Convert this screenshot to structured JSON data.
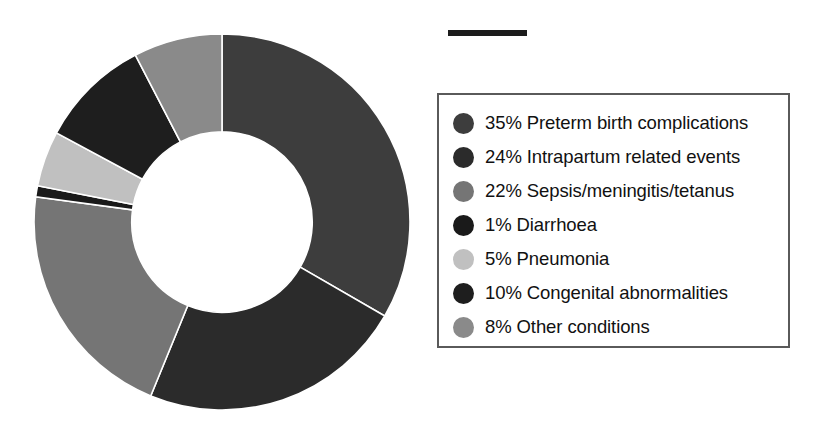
{
  "figure": {
    "background_color": "#ffffff",
    "title_rule": {
      "name": "title-rule",
      "color": "#1c1c1c"
    }
  },
  "chart_data": {
    "type": "pie",
    "variant": "donut",
    "title": "",
    "subtitle": "",
    "xlabel": "",
    "ylabel": "",
    "grid": false,
    "legend_position": "right",
    "hole_ratio": 0.48,
    "start_angle_deg": 0,
    "direction": "clockwise",
    "units": "percent",
    "total": 105,
    "categories": [
      "Preterm birth complications",
      "Intrapartum related events",
      "Sepsis/meningitis/tetanus",
      "Diarrhoea",
      "Pneumonia",
      "Congenital abnormalities",
      "Other conditions"
    ],
    "values": [
      35,
      24,
      22,
      1,
      5,
      10,
      8
    ],
    "colors": [
      "#3d3d3d",
      "#2b2b2b",
      "#757575",
      "#1a1a1a",
      "#c0c0c0",
      "#1e1e1e",
      "#8a8a8a"
    ],
    "slices": [
      {
        "percent_label": "35%",
        "label": "Preterm birth complications",
        "value": 35,
        "color": "#3d3d3d"
      },
      {
        "percent_label": "24%",
        "label": "Intrapartum related events",
        "value": 24,
        "color": "#2b2b2b"
      },
      {
        "percent_label": "22%",
        "label": "Sepsis/meningitis/tetanus",
        "value": 22,
        "color": "#757575"
      },
      {
        "percent_label": "1%",
        "label": "Diarrhoea",
        "value": 1,
        "color": "#1a1a1a"
      },
      {
        "percent_label": "5%",
        "label": "Pneumonia",
        "value": 5,
        "color": "#c0c0c0"
      },
      {
        "percent_label": "10%",
        "label": "Congenital abnormalities",
        "value": 10,
        "color": "#1e1e1e"
      },
      {
        "percent_label": "8%",
        "label": "Other conditions",
        "value": 8,
        "color": "#8a8a8a"
      }
    ]
  },
  "legend": {
    "border_color": "#5a5a5a",
    "items": [
      {
        "text": "35% Preterm birth complications",
        "color": "#3d3d3d"
      },
      {
        "text": "24% Intrapartum related events",
        "color": "#2b2b2b"
      },
      {
        "text": "22% Sepsis/meningitis/tetanus",
        "color": "#757575"
      },
      {
        "text": "1% Diarrhoea",
        "color": "#1a1a1a"
      },
      {
        "text": "5% Pneumonia",
        "color": "#c0c0c0"
      },
      {
        "text": "10% Congenital abnormalities",
        "color": "#1e1e1e"
      },
      {
        "text": "8% Other conditions",
        "color": "#8a8a8a"
      }
    ]
  }
}
